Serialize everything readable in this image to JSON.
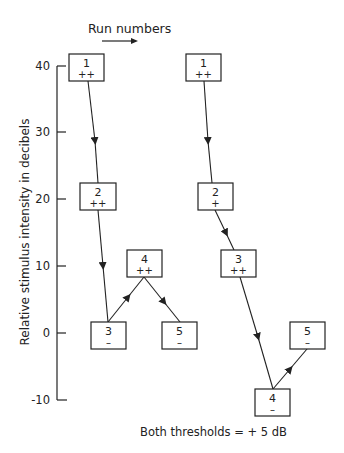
{
  "header": {
    "run_numbers_label": "Run numbers"
  },
  "axis": {
    "ylabel": "Relative stimulus intensity in decibels",
    "ticks": [
      "40",
      "30",
      "20",
      "10",
      "0",
      "-10"
    ]
  },
  "footer": {
    "caption": "Both thresholds = + 5 dB"
  },
  "sequence_left": {
    "runs": [
      {
        "num": "1",
        "resp": "++",
        "level_db": 40
      },
      {
        "num": "2",
        "resp": "++",
        "level_db": 20
      },
      {
        "num": "3",
        "resp": "–",
        "level_db": 0
      },
      {
        "num": "4",
        "resp": "++",
        "level_db": 10
      },
      {
        "num": "5",
        "resp": "–",
        "level_db": 0
      }
    ]
  },
  "sequence_right": {
    "runs": [
      {
        "num": "1",
        "resp": "++",
        "level_db": 40
      },
      {
        "num": "2",
        "resp": "+",
        "level_db": 20
      },
      {
        "num": "3",
        "resp": "++",
        "level_db": 10
      },
      {
        "num": "4",
        "resp": "–",
        "level_db": -10
      },
      {
        "num": "5",
        "resp": "–",
        "level_db": 0
      }
    ]
  }
}
